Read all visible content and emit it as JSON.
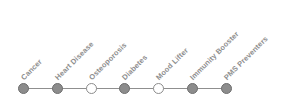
{
  "chart_data": {
    "type": "timeline",
    "title": "",
    "xlabel": "",
    "ylabel": "",
    "orientation": "horizontal",
    "label_rotation_deg": 45,
    "categories": [
      "Cancer",
      "Heart Disease",
      "Osteoporosis",
      "Diabetes",
      "Mood Lifter",
      "Immunity Booster",
      "PMS Preventers"
    ],
    "marker_states": [
      "filled",
      "filled",
      "hollow",
      "filled",
      "hollow",
      "filled",
      "filled"
    ],
    "x_positions": [
      23,
      57,
      91,
      124,
      158,
      192,
      226
    ],
    "baseline_y": 88,
    "colors": {
      "marker_filled": "#8c8c8c",
      "marker_filled_border": "#6e6e6e",
      "marker_hollow": "#ffffff",
      "marker_hollow_border": "#8c8c8c",
      "line": "#8f8f8f",
      "label_text": "#8e8e8e",
      "background": "#ffffff"
    },
    "nodes": [
      {
        "label": "Cancer",
        "state": "filled",
        "x": 23,
        "label_x": 25,
        "label_y": 74
      },
      {
        "label": "Heart Disease",
        "state": "filled",
        "x": 57,
        "label_x": 59,
        "label_y": 74
      },
      {
        "label": "Osteoporosis",
        "state": "hollow",
        "x": 91,
        "label_x": 93,
        "label_y": 74
      },
      {
        "label": "Diabetes",
        "state": "filled",
        "x": 124,
        "label_x": 126,
        "label_y": 74
      },
      {
        "label": "Mood Lifter",
        "state": "hollow",
        "x": 158,
        "label_x": 160,
        "label_y": 74
      },
      {
        "label": "Immunity Booster",
        "state": "filled",
        "x": 192,
        "label_x": 194,
        "label_y": 74
      },
      {
        "label": "PMS Preventers",
        "state": "filled",
        "x": 226,
        "label_x": 228,
        "label_y": 74
      }
    ]
  }
}
